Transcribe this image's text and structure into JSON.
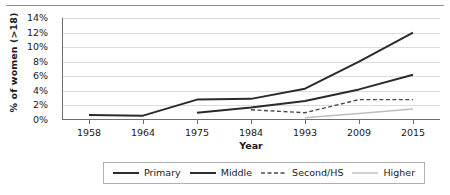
{
  "chart_data": {
    "type": "line",
    "title": "",
    "xlabel": "Year",
    "ylabel": "% of women (>18)",
    "categories": [
      "1958",
      "1964",
      "1975",
      "1984",
      "1993",
      "2009",
      "2015"
    ],
    "ylim": [
      0,
      14
    ],
    "ytick_labels": [
      "0%",
      "2%",
      "4%",
      "6%",
      "8%",
      "10%",
      "12%",
      "14%"
    ],
    "ytick_values": [
      0,
      2,
      4,
      6,
      8,
      10,
      12,
      14
    ],
    "grid": true,
    "legend_position": "bottom",
    "series": [
      {
        "name": "Primary",
        "color": "#2b2b2b",
        "style": "solid",
        "width": 2.0,
        "x": [
          "1958",
          "1964",
          "1975",
          "1984",
          "1993",
          "2009",
          "2015"
        ],
        "values": [
          0.7,
          0.6,
          2.8,
          2.9,
          4.3,
          8.0,
          12.0
        ]
      },
      {
        "name": "Middle",
        "color": "#2b2b2b",
        "style": "solid",
        "width": 2.0,
        "x": [
          "1975",
          "1984",
          "1993",
          "2009",
          "2015"
        ],
        "values": [
          1.0,
          1.7,
          2.6,
          4.2,
          6.2
        ]
      },
      {
        "name": "Second/HS",
        "color": "#4a4a4a",
        "style": "dashed",
        "width": 1.4,
        "x": [
          "1984",
          "1993",
          "2009",
          "2015"
        ],
        "values": [
          1.4,
          1.0,
          2.8,
          2.8
        ]
      },
      {
        "name": "Higher",
        "color": "#bdbdbd",
        "style": "solid",
        "width": 1.4,
        "x": [
          "1993",
          "2009",
          "2015"
        ],
        "values": [
          0.3,
          0.9,
          1.5
        ]
      }
    ]
  },
  "colors": {
    "gridline": "#dcdcdc",
    "axis": "#6e6e6e",
    "text": "#1a1a1a",
    "legend_border": "#b0b0b0",
    "top_rule": "#8e8e8e"
  }
}
